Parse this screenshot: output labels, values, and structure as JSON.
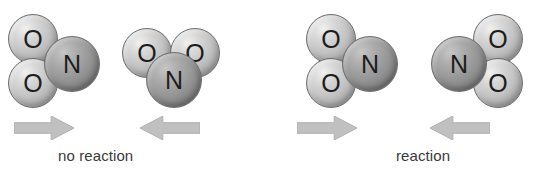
{
  "figure": {
    "background_color": "#ffffff",
    "width": 540,
    "height": 174,
    "atom_colors": {
      "oxygen": "#c2c2c2",
      "nitrogen": "#949494",
      "outline": "#6d6d6d",
      "arrow": "#c0c0c0",
      "arrow_outline": "#b0b0b0",
      "text": "#3a3a3a"
    }
  },
  "panels": [
    {
      "id": "left-panel",
      "caption": "no reaction",
      "molecules": [
        {
          "id": "molecule-1",
          "formula": "NO2",
          "atoms": [
            {
              "element": "O",
              "label": "O",
              "x": 8,
              "y": 14,
              "size": 50
            },
            {
              "element": "O",
              "label": "O",
              "x": 8,
              "y": 58,
              "size": 50
            },
            {
              "element": "N",
              "label": "N",
              "x": 44,
              "y": 36,
              "size": 56
            }
          ]
        },
        {
          "id": "molecule-2",
          "formula": "NO2",
          "atoms": [
            {
              "element": "O",
              "label": "O",
              "x": 122,
              "y": 28,
              "size": 50
            },
            {
              "element": "O",
              "label": "O",
              "x": 170,
              "y": 28,
              "size": 50
            },
            {
              "element": "N",
              "label": "N",
              "x": 146,
              "y": 52,
              "size": 56
            }
          ]
        }
      ],
      "arrows": [
        {
          "id": "arrow-left-forward",
          "direction": "right",
          "x": 14,
          "y": 116,
          "width": 60,
          "height": 24
        },
        {
          "id": "arrow-left-reverse",
          "direction": "left",
          "x": 140,
          "y": 116,
          "width": 60,
          "height": 24
        }
      ]
    },
    {
      "id": "right-panel",
      "caption": "reaction",
      "molecules": [
        {
          "id": "molecule-3",
          "formula": "NO2",
          "atoms": [
            {
              "element": "O",
              "label": "O",
              "x": 306,
              "y": 14,
              "size": 50
            },
            {
              "element": "O",
              "label": "O",
              "x": 306,
              "y": 58,
              "size": 50
            },
            {
              "element": "N",
              "label": "N",
              "x": 342,
              "y": 36,
              "size": 56
            }
          ]
        },
        {
          "id": "molecule-4",
          "formula": "NO2",
          "atoms": [
            {
              "element": "O",
              "label": "O",
              "x": 473,
              "y": 14,
              "size": 50
            },
            {
              "element": "O",
              "label": "O",
              "x": 473,
              "y": 58,
              "size": 50
            },
            {
              "element": "N",
              "label": "N",
              "x": 431,
              "y": 36,
              "size": 56
            }
          ]
        }
      ],
      "arrows": [
        {
          "id": "arrow-right-forward",
          "direction": "right",
          "x": 297,
          "y": 116,
          "width": 60,
          "height": 24
        },
        {
          "id": "arrow-right-reverse",
          "direction": "left",
          "x": 430,
          "y": 116,
          "width": 60,
          "height": 24
        }
      ]
    }
  ],
  "captions": [
    {
      "id": "caption-no-reaction",
      "text": "no reaction",
      "x": 58,
      "y": 147
    },
    {
      "id": "caption-reaction",
      "text": "reaction",
      "x": 396,
      "y": 147
    }
  ]
}
